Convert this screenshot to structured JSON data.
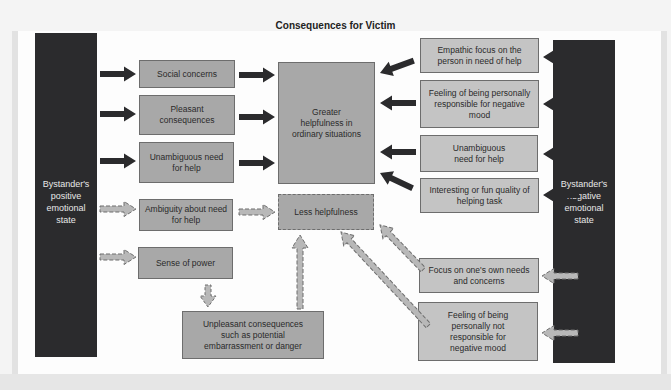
{
  "title": "Consequences for Victim",
  "left_source": {
    "label": "Bystander's positive emotional state"
  },
  "right_source": {
    "label": "Bystander's negative emotional state"
  },
  "left_factors": [
    {
      "label": "Social concerns",
      "link": "solid"
    },
    {
      "label": "Pleasant consequences",
      "link": "solid"
    },
    {
      "label": "Unambiguous need for help",
      "link": "solid"
    },
    {
      "label": "Ambiguity about need for help",
      "link": "dashed"
    },
    {
      "label": "Sense of power",
      "link": "dashed"
    }
  ],
  "outcomes": {
    "greater": "Greater helpfulness in ordinary situations",
    "less": "Less helpfulness"
  },
  "unpleasant": "Unpleasant consequences such as potential embarrassment or danger",
  "right_factors": [
    {
      "label": "Empathic focus on the person in need of help",
      "link": "solid"
    },
    {
      "label": "Feeling of being personally responsible for negative mood",
      "link": "solid"
    },
    {
      "label": "Unambiguous need for help",
      "link": "solid"
    },
    {
      "label": "Interesting or fun quality of helping task",
      "link": "solid"
    },
    {
      "label": "Focus on one's own needs and concerns",
      "link": "dashed"
    },
    {
      "label": "Feeling of being personally not responsible for negative mood",
      "link": "dashed"
    }
  ],
  "legend_arrows": {
    "solid": "arrow-solid-dark",
    "dashed": "arrow-dashed-light"
  },
  "colors": {
    "dark_bar": "#2b2b2d",
    "box_mid": "#a8a8a8",
    "box_light": "#c4c4c4",
    "arrow_solid": "#2b2b2d",
    "arrow_dashed_fill": "#b8b8b8",
    "arrow_dashed_stroke": "#6d6d6d"
  }
}
